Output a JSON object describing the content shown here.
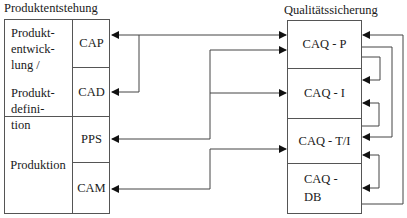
{
  "left_group": {
    "title": "Produktentstehung",
    "phases": [
      {
        "label_lines": [
          "Produkt-",
          "entwick-",
          "lung /",
          "",
          "Produkt-",
          "defini-",
          "tion"
        ]
      },
      {
        "label": "Produktion"
      }
    ],
    "systems": [
      "CAP",
      "CAD",
      "PPS",
      "CAM"
    ]
  },
  "right_group": {
    "title": "Qualitätssicherung",
    "modules": [
      "CAQ - P",
      "CAQ - I",
      "CAQ - T/I",
      "CAQ -",
      "DB"
    ]
  },
  "connections": [
    {
      "from": "CAP",
      "to": "CAQ - P",
      "type": "bidirectional"
    },
    {
      "from": "CAQ - P",
      "to": "CAD",
      "type": "branch"
    },
    {
      "from": "PPS",
      "to": "CAQ - P"
    },
    {
      "from": "PPS",
      "to": "CAQ - I"
    },
    {
      "from": "CAM",
      "to": "CAQ - T/I"
    },
    {
      "from": "CAQ - DB",
      "to": "CAQ - P"
    },
    {
      "from": "CAQ - P",
      "to": "CAQ - T/I"
    },
    {
      "from": "CAQ - P",
      "to": "CAQ - I"
    },
    {
      "from": "CAQ - T/I",
      "to": "CAQ - I"
    },
    {
      "from": "CAQ - DB",
      "to": "CAQ - T/I"
    }
  ],
  "colors": {
    "line": "#444444",
    "border": "#555555",
    "text": "#1a1a1a"
  }
}
